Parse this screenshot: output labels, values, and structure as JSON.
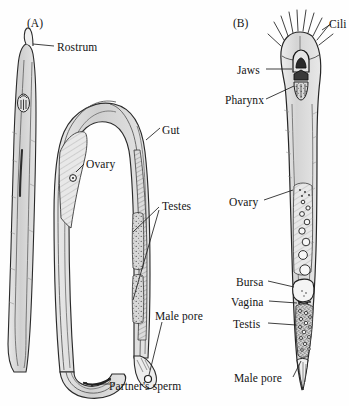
{
  "figure": {
    "kind": "anatomical-line-drawing",
    "style": "pen-and-ink stipple and hatch, greyscale on white",
    "background_color": "#fefefe",
    "ink_color": "#1a1a1a",
    "fill_color": "#cfcfcf",
    "panels": [
      {
        "id": "A",
        "panel_label": "(A)",
        "description": "Whole mated flatworm, long slender body folded into a U, shown with partner's sperm in the tail",
        "labels": [
          {
            "key": "rostrum",
            "text": "Rostrum"
          },
          {
            "key": "gut",
            "text": "Gut"
          },
          {
            "key": "ovary",
            "text": "Ovary"
          },
          {
            "key": "testes",
            "text": "Testes"
          },
          {
            "key": "male_pore",
            "text": "Male pore"
          },
          {
            "key": "partners_sperm",
            "text": "Partner's sperm"
          }
        ]
      },
      {
        "id": "B",
        "panel_label": "(B)",
        "description": "Detailed whole-body anatomy of a second flatworm, anterior ciliated head at top, male pore at posterior tip",
        "labels": [
          {
            "key": "cilia",
            "text": "Cili"
          },
          {
            "key": "jaws",
            "text": "Jaws"
          },
          {
            "key": "pharynx",
            "text": "Pharynx"
          },
          {
            "key": "ovary",
            "text": "Ovary"
          },
          {
            "key": "bursa",
            "text": "Bursa"
          },
          {
            "key": "vagina",
            "text": "Vagina"
          },
          {
            "key": "testis",
            "text": "Testis"
          },
          {
            "key": "male_pore",
            "text": "Male pore"
          }
        ]
      }
    ]
  }
}
